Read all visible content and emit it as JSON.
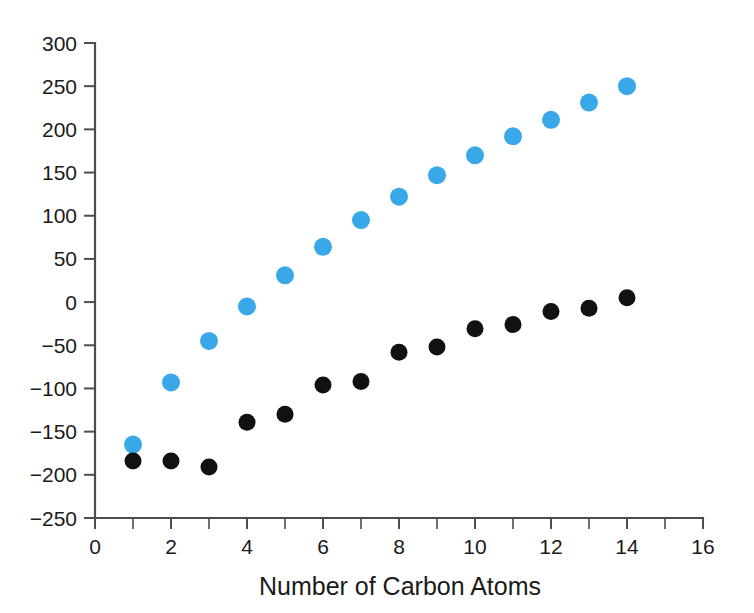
{
  "chart_data": {
    "type": "scatter",
    "title": "",
    "xlabel": "Number of Carbon Atoms",
    "ylabel": "",
    "xlim": [
      0,
      16
    ],
    "ylim": [
      -250,
      300
    ],
    "grid": false,
    "legend": "none",
    "x_ticks": [
      0,
      2,
      4,
      6,
      8,
      10,
      12,
      14,
      16
    ],
    "x_tick_labels": [
      "0",
      "2",
      "4",
      "6",
      "8",
      "10",
      "12",
      "14",
      "16"
    ],
    "x_minor_tick_step": 1,
    "y_ticks": [
      -250,
      -200,
      -150,
      -100,
      -50,
      0,
      50,
      100,
      150,
      200,
      250,
      300
    ],
    "y_tick_labels": [
      "−250",
      "−200",
      "−150",
      "−100",
      "−50",
      "0",
      "50",
      "100",
      "150",
      "200",
      "250",
      "300"
    ],
    "x": [
      1,
      2,
      3,
      4,
      5,
      6,
      7,
      8,
      9,
      10,
      11,
      12,
      13,
      14
    ],
    "series": [
      {
        "name": "blue-series",
        "color": "#38a8e8",
        "marker": "circle",
        "marker_size_px": 18,
        "values": [
          -165,
          -93,
          -45,
          -5,
          31,
          64,
          95,
          122,
          147,
          170,
          192,
          211,
          231,
          250
        ]
      },
      {
        "name": "black-series",
        "color": "#111111",
        "marker": "circle",
        "marker_size_px": 17,
        "values": [
          -184,
          -184,
          -191,
          -139,
          -130,
          -96,
          -92,
          -58,
          -52,
          -31,
          -26,
          -11,
          -7,
          5
        ]
      }
    ]
  },
  "axis_style": {
    "line_color": "#4d4d4d",
    "text_color": "#1a1a1a"
  }
}
